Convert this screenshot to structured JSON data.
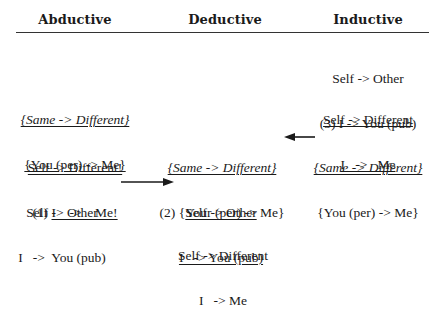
{
  "headers": {
    "abductive": "Abductive",
    "deductive": "Deductive",
    "inductive": "Inductive"
  },
  "inductive": {
    "block1": {
      "line1": "Self -> Other",
      "line2": "(3) I -> You (pub)"
    },
    "block2": {
      "line1": "Self -> Different",
      "line2": "I   ->   Me"
    },
    "block3": {
      "line1": "{Same -> Different}",
      "line2": "{You (per) -> Me}"
    }
  },
  "abductive": {
    "block1": {
      "line1": "{Same -> Different}",
      "line2": "{You (per) -> Me}"
    },
    "block2": {
      "line1": "Self -> Different!",
      "line2_prefix": "(1) ",
      "line2_main": "I    ->    Me!"
    },
    "block3": {
      "line1": "Self -> Other",
      "line2": "I   ->  You (pub)"
    }
  },
  "deductive": {
    "block1": {
      "line1": "{Same -> Different}",
      "line2": "(2) {Your (per) -> Me}"
    },
    "block2": {
      "line1": "Self -> Other",
      "line2": "I   -> You (pub)"
    },
    "block3": {
      "line1": "Self -> Different",
      "line2": "I   -> Me"
    }
  },
  "arrows": [
    {
      "from": "inductive.block3",
      "to": "deductive.block1",
      "direction": "left"
    },
    {
      "from": "abductive.block3",
      "to": "deductive.block2",
      "direction": "right"
    }
  ],
  "colors": {
    "text": "#1a1a1a",
    "rule": "#333333",
    "background": "#ffffff"
  }
}
